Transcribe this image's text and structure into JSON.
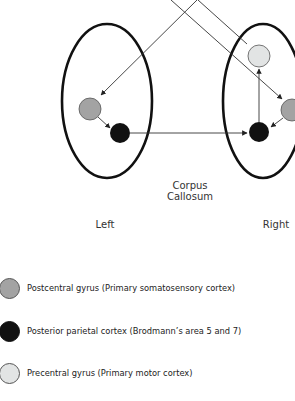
{
  "labels": {
    "corpus": "Corpus",
    "callosum": "Callosum",
    "left": "Left",
    "right": "Right"
  },
  "colors": {
    "postcentral": "#a3a3a3",
    "posterior_parietal": "#111111",
    "precentral": "#e2e4e4",
    "outline": "#111111",
    "line": "#333333"
  },
  "legend": [
    {
      "label": "Postcentral gyrus (Primary somatosensory cortex)",
      "color": "#a3a3a3"
    },
    {
      "label": "Posterior parietal cortex (Brodmann’s area 5 and 7)",
      "color": "#111111"
    },
    {
      "label": "Precentral gyrus (Primary motor cortex)",
      "color": "#e2e4e4"
    }
  ]
}
